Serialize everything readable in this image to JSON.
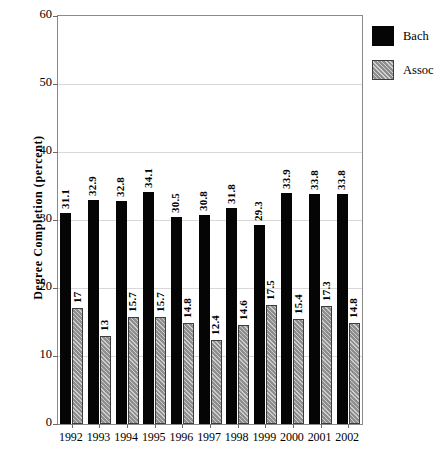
{
  "chart_data": {
    "type": "bar",
    "title": "",
    "xlabel": "",
    "ylabel": "Degree Completion (percent)",
    "ylim": [
      0,
      60
    ],
    "yticks": [
      0,
      10,
      20,
      30,
      40,
      50,
      60
    ],
    "ytick_labels": [
      "0",
      "10",
      "20",
      "30",
      "40",
      "50",
      "60"
    ],
    "grid": true,
    "legend_position": "top-right-outside",
    "categories": [
      "1992",
      "1993",
      "1994",
      "1995",
      "1996",
      "1997",
      "1998",
      "1999",
      "2000",
      "2001",
      "2002"
    ],
    "series": [
      {
        "name": "Bach",
        "color": "#050505",
        "pattern": "solid",
        "values": [
          31.1,
          32.9,
          32.8,
          34.1,
          30.5,
          30.8,
          31.8,
          29.3,
          33.9,
          33.8,
          33.8
        ],
        "labels": [
          "31.1",
          "32.9",
          "32.8",
          "34.1",
          "30.5",
          "30.8",
          "31.8",
          "29.3",
          "33.9",
          "33.8",
          "33.8"
        ]
      },
      {
        "name": "Assoc",
        "color": "#8e8e8e",
        "pattern": "diagonal-hatch",
        "values": [
          17,
          13,
          15.7,
          15.7,
          14.8,
          12.4,
          14.6,
          17.5,
          15.4,
          17.3,
          14.8
        ],
        "labels": [
          "17",
          "13",
          "15.7",
          "15.7",
          "14.8",
          "12.4",
          "14.6",
          "17.5",
          "15.4",
          "17.3",
          "14.8"
        ]
      }
    ]
  },
  "legend": {
    "entries": [
      {
        "label": "Bach",
        "swatch": "black-solid-swatch"
      },
      {
        "label": "Assoc",
        "swatch": "gray-hatched-swatch"
      }
    ]
  },
  "colors": {
    "bach": "#050505",
    "assoc": "#8e8e8e",
    "gridline": "#d8d8d8",
    "axis": "#8a8a8a",
    "background": "#ffffff"
  }
}
